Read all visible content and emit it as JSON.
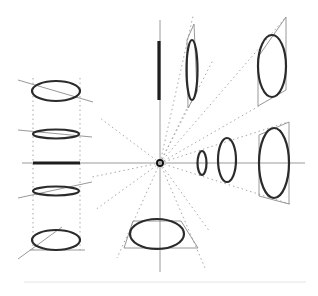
{
  "diagram": {
    "title": "",
    "vanishing_point": {
      "x": 160,
      "y": 163
    },
    "colors": {
      "ellipse_stroke": "#2b2b2b",
      "guide_stroke": "#a8a8a8",
      "axis_stroke": "#9a9a9a",
      "background": "#ffffff"
    },
    "groups": [
      {
        "name": "top-vertical-axis",
        "items": [
          "edge-on bar",
          "narrow ellipse",
          "wide ellipse in parallelogram"
        ]
      },
      {
        "name": "right-horizontal-axis",
        "items": [
          "small ellipse",
          "medium ellipse",
          "large ellipse"
        ]
      },
      {
        "name": "bottom-vertical-axis",
        "items": [
          "horizontal ellipse in trapezoid"
        ]
      },
      {
        "name": "left-column",
        "items": [
          "tilted ellipse top",
          "thin ellipse upper",
          "edge-on bar",
          "thin ellipse lower",
          "tilted ellipse bottom"
        ]
      }
    ]
  }
}
